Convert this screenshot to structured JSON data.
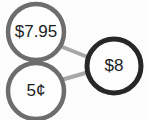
{
  "diagram": {
    "type": "node-link-graph",
    "background_color": "#fefefe",
    "nodes": [
      {
        "id": "node-price-795",
        "label": "$7.95",
        "cx": 36,
        "cy": 32,
        "r": 28,
        "stroke_color": "#6d6d6d",
        "stroke_width": 4.5,
        "fill_color": "#ffffff",
        "font_size": 17,
        "emphasis": "normal"
      },
      {
        "id": "node-price-5c",
        "label": "5¢",
        "cx": 36,
        "cy": 91,
        "r": 28,
        "stroke_color": "#6d6d6d",
        "stroke_width": 4.5,
        "fill_color": "#ffffff",
        "font_size": 17,
        "emphasis": "normal"
      },
      {
        "id": "node-price-8",
        "label": "$8",
        "cx": 114,
        "cy": 66,
        "r": 27,
        "stroke_color": "#272727",
        "stroke_width": 5,
        "fill_color": "#ffffff",
        "font_size": 17,
        "emphasis": "bold"
      }
    ],
    "edges": [
      {
        "id": "edge-795-to-8",
        "from": "node-price-795",
        "to": "node-price-8",
        "x1": 60,
        "y1": 46,
        "x2": 90,
        "y2": 58,
        "stroke_color": "#a8a8a8",
        "stroke_width": 4
      },
      {
        "id": "edge-5c-to-8",
        "from": "node-price-5c",
        "to": "node-price-8",
        "x1": 61,
        "y1": 80,
        "x2": 89,
        "y2": 72,
        "stroke_color": "#a8a8a8",
        "stroke_width": 4
      }
    ]
  }
}
